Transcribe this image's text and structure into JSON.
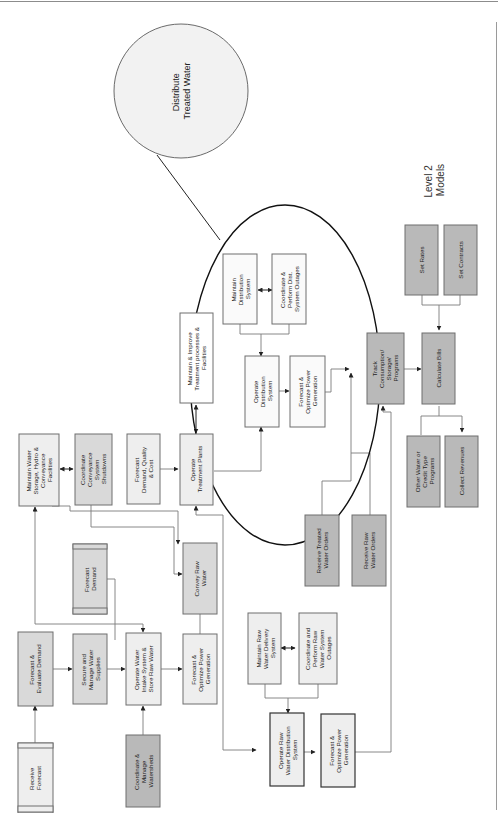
{
  "diagram": {
    "title": "Level 2 Models",
    "title_lines": [
      "Level 2",
      "Models"
    ],
    "callout": {
      "label": "Distribute Treated Water",
      "lines": [
        "Distribute",
        "Treated Water"
      ]
    },
    "nodes": [
      {
        "id": "receive-forecast",
        "label": "Receive Forecast",
        "lines": [
          "Receive",
          "Forecast"
        ],
        "style": "light-banded"
      },
      {
        "id": "forecast-evaluate-demand",
        "label": "Forecast & Evaluate Demand",
        "lines": [
          "Forecast &",
          "Evaluate Demand"
        ],
        "style": "mid"
      },
      {
        "id": "coordinate-manage-watersheds",
        "label": "Coordinate & Manage Watersheds",
        "lines": [
          "Coordinate &",
          "Manage",
          "Watersheds"
        ],
        "style": "dark"
      },
      {
        "id": "secure-manage-water-supplies",
        "label": "Secure and Manage Water Supplies",
        "lines": [
          "Secure and",
          "Manage Water",
          "Supplies"
        ],
        "style": "mid"
      },
      {
        "id": "operate-water-intake",
        "label": "Operate Water Intake System & Store Raw Water",
        "lines": [
          "Operate Water",
          "Intake System &",
          "Store Raw Water"
        ],
        "style": "light"
      },
      {
        "id": "forecast-demand",
        "label": "Forecast Demand",
        "lines": [
          "Forecast",
          "Demand"
        ],
        "style": "mid-banded"
      },
      {
        "id": "maintain-water-storage",
        "label": "Maintain Water Storage, Hydro & Conveyance Facilities",
        "lines": [
          "Maintain Water",
          "Storage, Hydro &",
          "Conveyance",
          "Facilities"
        ],
        "style": "light"
      },
      {
        "id": "coordinate-conveyance-shutdowns",
        "label": "Coordinate Conveyance System Shutdowns",
        "lines": [
          "Coordinate",
          "Conveyance",
          "System",
          "Shutdowns"
        ],
        "style": "mid"
      },
      {
        "id": "forecast-demand-quality-cost",
        "label": "Forecast Demand, Quality & Cost",
        "lines": [
          "Forecast",
          "Demand, Quality",
          "& Cost"
        ],
        "style": "light"
      },
      {
        "id": "forecast-optimize-power-1",
        "label": "Forecast & Optimize Power Generation",
        "lines": [
          "Forecast &",
          "Optimize Power",
          "Generation"
        ],
        "style": "light"
      },
      {
        "id": "convey-raw-water",
        "label": "Convey Raw Water",
        "lines": [
          "Convey Raw",
          "Water"
        ],
        "style": "mid"
      },
      {
        "id": "operate-treatment-plants",
        "label": "Operate Treatment Plants",
        "lines": [
          "Operate",
          "Treatment Plants"
        ],
        "style": "light"
      },
      {
        "id": "maintain-improve-treatment",
        "label": "Maintain & Improve Treatment processes & Facilities",
        "lines": [
          "Maintain & Improve",
          "Treatment processes &",
          "Facilities"
        ],
        "style": "white"
      },
      {
        "id": "maintain-raw-water-delivery",
        "label": "Maintain Raw Water Delivery System",
        "lines": [
          "Maintain Raw",
          "Water Delivery",
          "System"
        ],
        "style": "light"
      },
      {
        "id": "coordinate-raw-water-outages",
        "label": "Coordinate and Perform Raw Water System Outages",
        "lines": [
          "Coordinate and",
          "Perform Raw",
          "Water System",
          "Outages"
        ],
        "style": "light"
      },
      {
        "id": "operate-raw-water-distribution",
        "label": "Operate Raw Water Distribution System",
        "lines": [
          "Operate Raw",
          "Water Distribution",
          "System"
        ],
        "style": "light-strong"
      },
      {
        "id": "forecast-optimize-power-2",
        "label": "Forecast & Optimize Power Generation",
        "lines": [
          "Forecast &",
          "Optimize Power",
          "Generation"
        ],
        "style": "light-strong"
      },
      {
        "id": "maintain-distribution",
        "label": "Maintain Distribution System",
        "lines": [
          "Maintain",
          "Distribution",
          "System"
        ],
        "style": "white"
      },
      {
        "id": "coordinate-dist-outages",
        "label": "Coordinate & Perform Dist. System Outages",
        "lines": [
          "Coordinate &",
          "Perform Dist.",
          "System Outages"
        ],
        "style": "white"
      },
      {
        "id": "operate-distribution",
        "label": "Operate Distribution System",
        "lines": [
          "Operate",
          "Distribution",
          "System"
        ],
        "style": "white"
      },
      {
        "id": "forecast-optimize-power-3",
        "label": "Forecast & Optimize Power Generation",
        "lines": [
          "Forecast &",
          "Optimize Power",
          "Generation"
        ],
        "style": "white"
      },
      {
        "id": "receive-treated-water-orders",
        "label": "Receive Treated Water Orders",
        "lines": [
          "Receive Treated",
          "Water Orders"
        ],
        "style": "dark"
      },
      {
        "id": "receive-raw-water-orders",
        "label": "Receive Raw Water Orders",
        "lines": [
          "Receive Raw",
          "Water Orders"
        ],
        "style": "dark"
      },
      {
        "id": "track-consumption",
        "label": "Track Consumption/ Storage/ Programs",
        "lines": [
          "Track",
          "Consumption/",
          "Storage/",
          "Programs"
        ],
        "style": "dark"
      },
      {
        "id": "set-rates",
        "label": "Set Rates",
        "lines": [
          "Set Rates"
        ],
        "style": "dark"
      },
      {
        "id": "set-contracts",
        "label": "Set Contracts",
        "lines": [
          "Set Contracts"
        ],
        "style": "dark"
      },
      {
        "id": "calculate-bills",
        "label": "Calculate Bills",
        "lines": [
          "Calculate Bills"
        ],
        "style": "dark"
      },
      {
        "id": "other-water-credit",
        "label": "Other Water or Credit Type Programs",
        "lines": [
          "Other Water or",
          "Credit Type",
          "Programs"
        ],
        "style": "dark"
      },
      {
        "id": "collect-revenues",
        "label": "Collect Revenues",
        "lines": [
          "Collect Revenues"
        ],
        "style": "dark"
      }
    ],
    "colors": {
      "light_fill": "#eeeeee",
      "mid_fill": "#d9d9d9",
      "dark_fill": "#b9b9b9",
      "stroke": "#6e6e6e",
      "highlight_ellipse": "#111111"
    }
  }
}
